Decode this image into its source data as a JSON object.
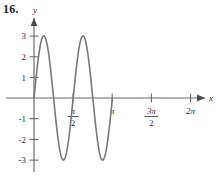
{
  "problem": {
    "number": "16."
  },
  "axes": {
    "x_label": "x",
    "y_label": "y",
    "axis_color": "#6b6b6b",
    "tick_color": "#6b6b6b"
  },
  "y_ticks": [
    {
      "label": "3",
      "value": 3
    },
    {
      "label": "2",
      "value": 2
    },
    {
      "label": "1",
      "value": 1
    },
    {
      "label": "-1",
      "value": -1
    },
    {
      "label": "-2",
      "value": -2
    },
    {
      "label": "-3",
      "value": -3
    }
  ],
  "x_ticks": [
    {
      "kind": "fraction",
      "numerator": "π",
      "denominator": "2",
      "label": "π/2",
      "value": 1.5707963
    },
    {
      "kind": "plain",
      "label": "π",
      "value": 3.1415927
    },
    {
      "kind": "fraction",
      "numerator": "3π",
      "denominator": "2",
      "label": "3π/2",
      "value": 4.712389
    },
    {
      "kind": "plain",
      "label": "2π",
      "value": 6.2831853
    }
  ],
  "chart_data": {
    "type": "line",
    "title": "",
    "xlabel": "x",
    "ylabel": "y",
    "curve_color": "#7a7a7a",
    "grid": false,
    "legend": "none",
    "xlim": [
      -0.35,
      7.0
    ],
    "ylim": [
      -3.6,
      3.6
    ],
    "amplitude": 3,
    "period": 3.1415927,
    "function": "y = 3 sin(2x)",
    "xtick_labels": [
      "π/2",
      "π",
      "3π/2",
      "2π"
    ],
    "xtick_values": [
      1.5707963,
      3.1415927,
      4.712389,
      6.2831853
    ],
    "ytick_labels": [
      "3",
      "2",
      "1",
      "-1",
      "-2",
      "-3"
    ],
    "ytick_values": [
      3,
      2,
      1,
      -1,
      -2,
      -3
    ],
    "key_points": [
      {
        "x": 0,
        "y": 0,
        "note": "origin start"
      },
      {
        "x": 0.7853982,
        "y": 3,
        "note": "first maximum"
      },
      {
        "x": 1.5707963,
        "y": 0,
        "note": "zero at pi/2"
      },
      {
        "x": 2.3561945,
        "y": -3,
        "note": "first minimum"
      },
      {
        "x": 3.1415927,
        "y": 0,
        "note": "zero at pi"
      },
      {
        "x": 3.9269908,
        "y": 3,
        "note": "second maximum"
      },
      {
        "x": 4.712389,
        "y": 0,
        "note": "zero at 3pi/2"
      },
      {
        "x": 5.4977871,
        "y": -3,
        "note": "second minimum"
      },
      {
        "x": 6.2831853,
        "y": 0,
        "note": "zero at 2pi"
      }
    ],
    "x": [
      0,
      0.0628319,
      0.1256637,
      0.1884956,
      0.2513274,
      0.3141593,
      0.3769911,
      0.439823,
      0.5026548,
      0.5654867,
      0.6283185,
      0.6911504,
      0.7539822,
      0.8168141,
      0.8796459,
      0.9424778,
      1.0053096,
      1.0681415,
      1.1309734,
      1.1938052,
      1.2566371,
      1.3194689,
      1.3823008,
      1.4451326,
      1.5079645,
      1.5707963,
      1.6336282,
      1.69646,
      1.7592919,
      1.8221237,
      1.8849556,
      1.9477874,
      2.0106193,
      2.0734512,
      2.136283,
      2.1991149,
      2.2619467,
      2.3247786,
      2.3876104,
      2.4504423,
      2.5132741,
      2.576106,
      2.6389378,
      2.7017697,
      2.7646015,
      2.8274334,
      2.8902652,
      2.9530971,
      3.0159289,
      3.0787608,
      3.1415927,
      3.2044245,
      3.2672564,
      3.3300882,
      3.3929201,
      3.4557519,
      3.5185838,
      3.5814156,
      3.6442475,
      3.7070793,
      3.7699112,
      3.832743,
      3.8955749,
      3.9584067,
      4.0212386,
      4.0840704,
      4.1469023,
      4.2097341,
      4.272566,
      4.3353979,
      4.3982297,
      4.4610616,
      4.5238934,
      4.5867253,
      4.6495571,
      4.712389,
      4.7752208,
      4.8380527,
      4.9008845,
      4.9637164,
      5.0265482,
      5.0893801,
      5.1522119,
      5.2150438,
      5.2778756,
      5.3407075,
      5.4035394,
      5.4663712,
      5.5292031,
      5.5920349,
      5.6548668,
      5.7176986,
      5.7805305,
      5.8433623,
      5.9061942,
      5.969026,
      6.0318579,
      6.0946897,
      6.1575216,
      6.2203534,
      6.2831853
    ],
    "y": [
      0,
      0.3764,
      0.7492,
      1.1147,
      1.4694,
      1.8098,
      2.1329,
      2.4353,
      2.7144,
      2.9676,
      3.1925,
      3.3873,
      3.5503,
      3.6803,
      3.7763,
      3.8376,
      3.8641,
      3.8557,
      3.8128,
      3.7361,
      3.6266,
      3.4856,
      3.3149,
      3.1164,
      2.8923,
      2.6452,
      2.3778,
      2.093,
      1.7939,
      1.4837,
      1.1658,
      0.8434,
      0.52,
      0.1989,
      -0.1167,
      -0.4235,
      -0.7185,
      -0.9988,
      -1.2617,
      -1.5046,
      -1.7252,
      -1.9215,
      -2.0918,
      -2.2345,
      -2.3485,
      -2.4331,
      -2.4878,
      -2.5124,
      -2.5072,
      -2.4728,
      -2.4101,
      -2.3203,
      -2.2051,
      -2.0663,
      -1.9062,
      -1.7271,
      -1.5317,
      -1.323,
      -1.1039,
      -0.8777,
      -0.6475,
      -0.4168,
      -0.1887,
      0.0336,
      0.2473,
      0.4496,
      0.6379,
      0.8098,
      0.9633,
      1.0964,
      1.2077,
      1.2959,
      1.3601,
      1.3998,
      1.4147,
      1.405,
      1.3712,
      1.314,
      1.2346,
      1.1344,
      1.0151,
      0.8789,
      0.728,
      0.5648,
      0.3921,
      0.2127,
      0.0295,
      -0.1545,
      -0.3366,
      -0.5139,
      -0.6838,
      -0.8438,
      -0.9915,
      -1.1248,
      -1.2417,
      -1.3406,
      -1.42,
      -1.4789,
      -1.5163,
      -1.5318,
      -1.5252
    ]
  }
}
